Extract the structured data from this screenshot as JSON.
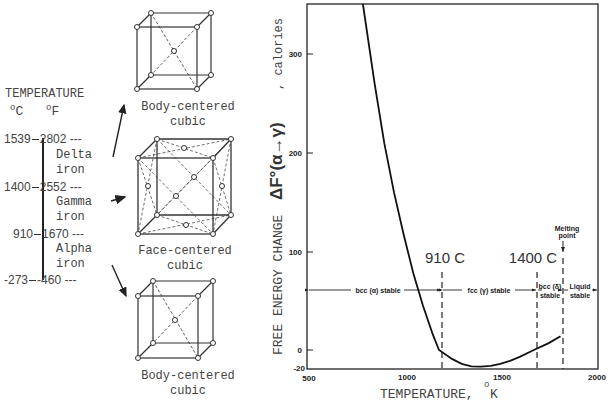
{
  "left_panel": {
    "title": "TEMPERATURE",
    "unit_c": "C",
    "unit_f": "F",
    "degree": "o",
    "scale": [
      {
        "c": "1539",
        "f": "2802"
      },
      {
        "c": "1400",
        "f": "2552"
      },
      {
        "c": "910",
        "f": "1670"
      },
      {
        "c": "-273",
        "f": "-460"
      }
    ],
    "phases": [
      {
        "line1": "Delta",
        "line2": "iron"
      },
      {
        "line1": "Gamma",
        "line2": "iron"
      },
      {
        "line1": "Alpha",
        "line2": "iron"
      }
    ],
    "structures": [
      {
        "line1": "Body-centered",
        "line2": "cubic"
      },
      {
        "line1": "Face-centered",
        "line2": "cubic"
      },
      {
        "line1": "Body-centered",
        "line2": "cubic"
      }
    ]
  },
  "chart_data": {
    "type": "line",
    "title": "",
    "xlabel": "TEMPERATURE, °K",
    "ylabel": "FREE ENERGY CHANGE ΔF°(α→γ), calories",
    "xlim": [
      500,
      2000
    ],
    "ylim": [
      -20,
      355
    ],
    "xticks": [
      500,
      1000,
      1500,
      2000
    ],
    "yticks": [
      -20,
      0,
      100,
      200,
      300
    ],
    "grid": false,
    "series": [
      {
        "name": "ΔF°(α→γ)",
        "x": [
          789,
          850,
          900,
          950,
          1000,
          1050,
          1100,
          1150,
          1183,
          1250,
          1300,
          1350,
          1400,
          1450,
          1500,
          1550,
          1600,
          1673,
          1750,
          1811
        ],
        "y": [
          352,
          270,
          210,
          160,
          117,
          78,
          45,
          16,
          0,
          -9,
          -14,
          -16.5,
          -17,
          -16,
          -14,
          -11,
          -7,
          0,
          7,
          14
        ]
      }
    ],
    "vertical_markers": [
      {
        "x": 1183,
        "label": "910 C"
      },
      {
        "x": 1673,
        "label": "1400 C"
      },
      {
        "x": 1811,
        "label": "Melting point"
      }
    ],
    "regions": [
      {
        "from": 500,
        "to": 1183,
        "label": "bcc (α) stable"
      },
      {
        "from": 1183,
        "to": 1673,
        "label": "fcc (γ) stable"
      },
      {
        "from": 1673,
        "to": 1811,
        "label": "bcc (δ) stable"
      },
      {
        "from": 1811,
        "to": 2000,
        "label": "Liquid stable"
      }
    ]
  },
  "chart_text": {
    "y_ticks": [
      "300",
      "200",
      "100",
      "0",
      "-20"
    ],
    "x_ticks": [
      "500",
      "1000",
      "1500",
      "2000"
    ],
    "y_label_main": "FREE ENERGY CHANGE",
    "y_label_symbol": "ΔF°(α→γ)",
    "y_label_unit": ", calories",
    "x_label": "TEMPERATURE,",
    "x_label_unit": "K",
    "marker_910": "910 C",
    "marker_1400": "1400 C",
    "melting_1": "Melting",
    "melting_2": "point",
    "region_alpha": "bcc (α) stable",
    "region_gamma": "fcc (γ) stable",
    "region_delta_1": "bcc (δ)",
    "region_delta_2": "stable",
    "region_liquid_1": "Liquid",
    "region_liquid_2": "stable"
  }
}
